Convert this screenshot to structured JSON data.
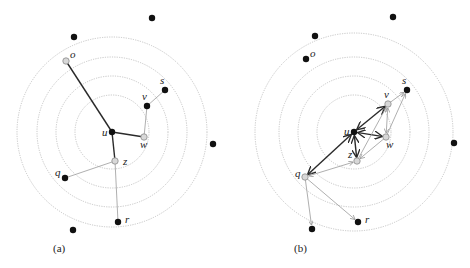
{
  "figure": {
    "panels": [
      {
        "id": "a",
        "caption": "(a)",
        "caption_pos": [
          53,
          252
        ],
        "center": [
          112,
          132
        ],
        "rings": [
          37,
          56,
          75,
          95
        ],
        "nodes": [
          {
            "id": "u",
            "label": "u",
            "x": 112,
            "y": 132,
            "style": "black",
            "label_dx": -10,
            "label_dy": 4
          },
          {
            "id": "o",
            "label": "o",
            "x": 66,
            "y": 61,
            "style": "gray",
            "label_dx": 4,
            "label_dy": -3
          },
          {
            "id": "v",
            "label": "v",
            "x": 147,
            "y": 106,
            "style": "black",
            "label_dx": -5,
            "label_dy": -6
          },
          {
            "id": "s",
            "label": "s",
            "x": 165,
            "y": 90,
            "style": "black",
            "label_dx": -5,
            "label_dy": -6
          },
          {
            "id": "w",
            "label": "w",
            "x": 144,
            "y": 137,
            "style": "gray",
            "label_dx": -4,
            "label_dy": 11
          },
          {
            "id": "z",
            "label": "z",
            "x": 115,
            "y": 161,
            "style": "gray",
            "label_dx": 8,
            "label_dy": 4
          },
          {
            "id": "q",
            "label": "q",
            "x": 65,
            "y": 178,
            "style": "black",
            "label_dx": -10,
            "label_dy": -2
          },
          {
            "id": "r",
            "label": "r",
            "x": 118,
            "y": 222,
            "style": "black",
            "label_dx": 7,
            "label_dy": 1
          },
          {
            "id": "n1",
            "label": "",
            "x": 152,
            "y": 18,
            "style": "black"
          },
          {
            "id": "n2",
            "label": "",
            "x": 74,
            "y": 37,
            "style": "black"
          },
          {
            "id": "n3",
            "label": "",
            "x": 213,
            "y": 144,
            "style": "black"
          },
          {
            "id": "n4",
            "label": "",
            "x": 73,
            "y": 230,
            "style": "black"
          }
        ],
        "edges": [
          {
            "from": "u",
            "to": "o",
            "style": "dark"
          },
          {
            "from": "u",
            "to": "w",
            "style": "dark"
          },
          {
            "from": "u",
            "to": "z",
            "style": "dark"
          },
          {
            "from": "w",
            "to": "v",
            "style": "light"
          },
          {
            "from": "v",
            "to": "s",
            "style": "light"
          },
          {
            "from": "z",
            "to": "q",
            "style": "light"
          },
          {
            "from": "z",
            "to": "r",
            "style": "light"
          }
        ]
      },
      {
        "id": "b",
        "caption": "(b)",
        "caption_pos": [
          294,
          252
        ],
        "center": [
          354,
          132
        ],
        "rings": [
          37,
          56,
          75,
          99
        ],
        "nodes": [
          {
            "id": "u",
            "label": "u",
            "x": 354,
            "y": 132,
            "style": "black",
            "label_dx": -10,
            "label_dy": 3
          },
          {
            "id": "o",
            "label": "o",
            "x": 306,
            "y": 59,
            "style": "black",
            "label_dx": 4,
            "label_dy": -2
          },
          {
            "id": "v",
            "label": "v",
            "x": 388,
            "y": 104,
            "style": "gray",
            "label_dx": -4,
            "label_dy": -6
          },
          {
            "id": "s",
            "label": "s",
            "x": 407,
            "y": 90,
            "style": "black",
            "label_dx": -5,
            "label_dy": -6
          },
          {
            "id": "w",
            "label": "w",
            "x": 386,
            "y": 137,
            "style": "gray",
            "label_dx": 0,
            "label_dy": 11
          },
          {
            "id": "z",
            "label": "z",
            "x": 357,
            "y": 161,
            "style": "gray",
            "label_dx": -9,
            "label_dy": -3
          },
          {
            "id": "q",
            "label": "q",
            "x": 305,
            "y": 177,
            "style": "gray",
            "label_dx": -10,
            "label_dy": 0
          },
          {
            "id": "r",
            "label": "r",
            "x": 358,
            "y": 222,
            "style": "black",
            "label_dx": 7,
            "label_dy": 1
          },
          {
            "id": "n1",
            "label": "",
            "x": 393,
            "y": 17,
            "style": "black"
          },
          {
            "id": "n2",
            "label": "",
            "x": 315,
            "y": 36,
            "style": "black"
          },
          {
            "id": "n3",
            "label": "",
            "x": 454,
            "y": 143,
            "style": "black"
          },
          {
            "id": "n4",
            "label": "",
            "x": 312,
            "y": 229,
            "style": "black"
          }
        ],
        "edges": [
          {
            "from": "u",
            "to": "v",
            "style": "dark",
            "arrows": "both"
          },
          {
            "from": "u",
            "to": "w",
            "style": "dark",
            "arrows": "both"
          },
          {
            "from": "u",
            "to": "z",
            "style": "dark",
            "arrows": "both"
          },
          {
            "from": "u",
            "to": "q",
            "style": "dark",
            "arrows": "both"
          },
          {
            "from": "v",
            "to": "s",
            "style": "light",
            "arrows": "end"
          },
          {
            "from": "w",
            "to": "s",
            "style": "light",
            "arrows": "end"
          },
          {
            "from": "w",
            "to": "v",
            "style": "light",
            "arrows": "both"
          },
          {
            "from": "z",
            "to": "v",
            "style": "light",
            "arrows": "end"
          },
          {
            "from": "w",
            "to": "z",
            "style": "light",
            "arrows": "end"
          },
          {
            "from": "q",
            "to": "z",
            "style": "light",
            "arrows": "both"
          },
          {
            "from": "q",
            "to": "r",
            "style": "light",
            "arrows": "end"
          },
          {
            "from": "q",
            "to": "n4",
            "style": "light",
            "arrows": "end"
          }
        ]
      }
    ],
    "colors": {
      "node_black": "#111111",
      "node_gray_fill": "#d8d8d8",
      "edge_dark": "#2a2a2a",
      "edge_light": "#9a9a9a",
      "ring": "#b8b8b8"
    }
  }
}
